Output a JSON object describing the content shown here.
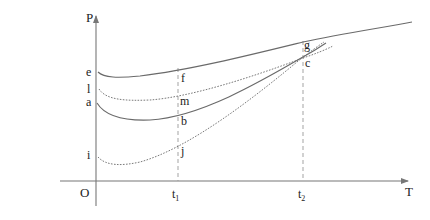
{
  "diagram": {
    "axes": {
      "y_label": "P",
      "x_label": "T",
      "origin_label": "O"
    },
    "x_ticks": [
      {
        "label": "t",
        "sub": "1"
      },
      {
        "label": "t",
        "sub": "2"
      }
    ],
    "start_labels": {
      "e": "e",
      "l": "l",
      "a": "a",
      "i": "i"
    },
    "t1_labels": {
      "f": "f",
      "m": "m",
      "b": "b",
      "j": "j"
    },
    "t2_labels": {
      "g": "g",
      "c": "c"
    },
    "curves": [
      {
        "name": "e-f-g",
        "style": "solid",
        "points": [
          "e",
          "f",
          "g"
        ]
      },
      {
        "name": "l-m-c",
        "style": "dotted",
        "points": [
          "l",
          "m",
          "c"
        ]
      },
      {
        "name": "a-b-c",
        "style": "solid",
        "points": [
          "a",
          "b",
          "c"
        ]
      },
      {
        "name": "i-j-c",
        "style": "dotted",
        "points": [
          "i",
          "j",
          "c"
        ]
      }
    ]
  }
}
